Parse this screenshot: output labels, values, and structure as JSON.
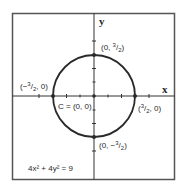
{
  "figure": {
    "type": "circle-graph",
    "equation": "4x² + 4y² = 9",
    "axes": {
      "x_label": "x",
      "y_label": "y"
    },
    "center": {
      "label": "C = (0, 0)",
      "x": 0,
      "y": 0
    },
    "radius": 1.5,
    "points": [
      {
        "name": "top",
        "label_prefix": "(0, ",
        "num": "3",
        "den": "2",
        "label_suffix": ")",
        "x": 0,
        "y": 1.5
      },
      {
        "name": "left",
        "label_prefix": "(−",
        "num": "3",
        "den": "2",
        "label_suffix": ", 0)",
        "x": -1.5,
        "y": 0
      },
      {
        "name": "right",
        "label_prefix": "(",
        "num": "3",
        "den": "2",
        "label_suffix": ", 0)",
        "x": 1.5,
        "y": 0
      },
      {
        "name": "bottom",
        "label_prefix": "(0, −",
        "num": "3",
        "den": "2",
        "label_suffix": ")",
        "x": 0,
        "y": -1.5
      }
    ],
    "colors": {
      "stroke": "#2a2a2a",
      "frame": "#555555",
      "background": "#ffffff"
    }
  }
}
